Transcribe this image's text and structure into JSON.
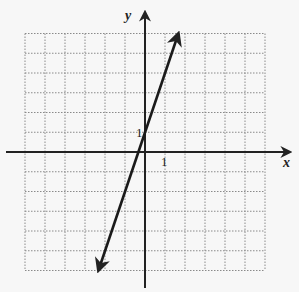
{
  "chart_data": {
    "type": "line",
    "title": "",
    "xlabel": "x",
    "ylabel": "y",
    "xlim": [
      -6,
      6
    ],
    "ylim": [
      -6,
      6
    ],
    "grid": true,
    "grid_style": "dotted",
    "tick_labels": {
      "x": [
        "1"
      ],
      "y": [
        "1"
      ]
    },
    "series": [
      {
        "name": "line",
        "equation": "y = 3x + 1",
        "slope": 3,
        "intercept": 1,
        "x": [
          -2.33,
          1.67
        ],
        "y": [
          -6,
          6
        ],
        "arrows": "both"
      }
    ]
  },
  "labels": {
    "x_axis": "x",
    "y_axis": "y",
    "x_tick": "1",
    "y_tick": "1"
  },
  "colors": {
    "background": "#f7f7f7",
    "grid": "#888888",
    "axis": "#222222",
    "line": "#1a1a1a"
  }
}
